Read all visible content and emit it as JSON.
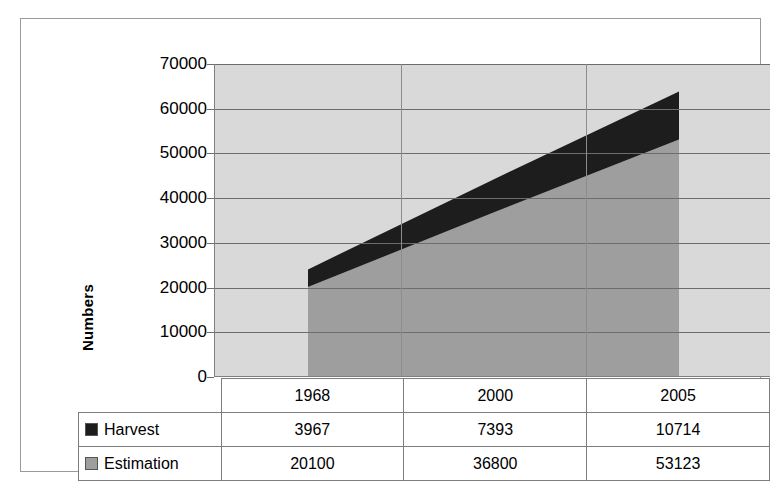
{
  "chart_data": {
    "type": "area",
    "stacked": true,
    "title": "",
    "xlabel": "",
    "ylabel": "Numbers",
    "categories": [
      "1968",
      "2000",
      "2005"
    ],
    "series": [
      {
        "name": "Harvest",
        "values": [
          3967,
          7393,
          10714
        ],
        "color": "#1d1d1d",
        "swatch": "black-square-marker"
      },
      {
        "name": "Estimation",
        "values": [
          20100,
          36800,
          53123
        ],
        "color": "#9e9e9e",
        "swatch": "gray-square-marker"
      }
    ],
    "stack_order": [
      "Estimation",
      "Harvest"
    ],
    "totals": [
      24067,
      44193,
      63837
    ],
    "ylim": [
      0,
      70000
    ],
    "ytick_step": 10000,
    "yticks": [
      "70000",
      "60000",
      "50000",
      "40000",
      "30000",
      "20000",
      "10000",
      "0"
    ],
    "grid": "horizontal-and-vertical",
    "legend_position": "data-table-left-column",
    "plot_background": "#d9d9d9"
  },
  "axis": {
    "y_title": "Numbers"
  },
  "table": {
    "header": [
      "",
      "1968",
      "2000",
      "2005"
    ],
    "rows": [
      {
        "label": "Harvest",
        "marker": "black-square-marker",
        "cells": [
          "3967",
          "7393",
          "10714"
        ]
      },
      {
        "label": "Estimation",
        "marker": "gray-square-marker",
        "cells": [
          "20100",
          "36800",
          "53123"
        ]
      }
    ]
  }
}
